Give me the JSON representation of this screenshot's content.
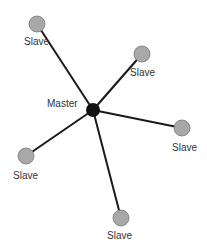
{
  "diagram": {
    "type": "star-topology",
    "master": {
      "label": "Master",
      "x": 93,
      "y": 110,
      "r": 7,
      "color": "#111111",
      "label_x": 47,
      "label_y": 104
    },
    "slaves": [
      {
        "label": "Slave",
        "x": 37,
        "y": 24,
        "r": 8,
        "label_x": 24,
        "label_y": 42
      },
      {
        "label": "Slave",
        "x": 142,
        "y": 54,
        "r": 8,
        "label_x": 130,
        "label_y": 73
      },
      {
        "label": "Slave",
        "x": 182,
        "y": 128,
        "r": 8,
        "label_x": 172,
        "label_y": 148
      },
      {
        "label": "Slave",
        "x": 26,
        "y": 156,
        "r": 8,
        "label_x": 13,
        "label_y": 176
      },
      {
        "label": "Slave",
        "x": 121,
        "y": 218,
        "r": 8,
        "label_x": 107,
        "label_y": 236
      }
    ],
    "slave_color": "#a8a8a8",
    "edge_color": "#1a1a1a"
  }
}
